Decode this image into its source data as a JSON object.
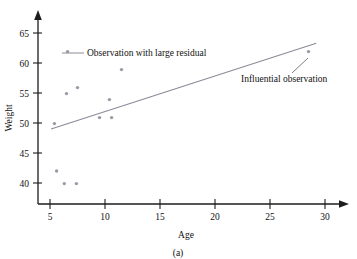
{
  "figure": {
    "caption": "(a)",
    "background": "#ffffff",
    "point_color": "#9a9aa6",
    "line_color": "#8b8b99",
    "axis_color": "#1d1d1d"
  },
  "chart_data": {
    "type": "scatter",
    "title": "",
    "xlabel": "Age",
    "ylabel": "Weight",
    "xlim": [
      3.2,
      32.5
    ],
    "ylim": [
      37.0,
      67.0
    ],
    "xticks": [
      5,
      10,
      15,
      20,
      25,
      30
    ],
    "yticks": [
      40,
      45,
      50,
      55,
      60,
      65
    ],
    "xtick_labels": [
      "5",
      "10",
      "15",
      "20",
      "25",
      "30"
    ],
    "ytick_labels": [
      "40",
      "45",
      "50",
      "55",
      "60",
      "65"
    ],
    "grid": false,
    "legend_position": "none",
    "points": [
      {
        "x": 5.4,
        "y": 49.9
      },
      {
        "x": 5.6,
        "y": 42.0
      },
      {
        "x": 6.3,
        "y": 39.9
      },
      {
        "x": 6.5,
        "y": 54.9
      },
      {
        "x": 6.6,
        "y": 61.9
      },
      {
        "x": 7.4,
        "y": 39.9
      },
      {
        "x": 7.5,
        "y": 55.9
      },
      {
        "x": 9.5,
        "y": 50.9
      },
      {
        "x": 10.4,
        "y": 53.9
      },
      {
        "x": 10.6,
        "y": 50.9
      },
      {
        "x": 11.5,
        "y": 58.9
      },
      {
        "x": 28.5,
        "y": 61.9
      }
    ],
    "fit_line": {
      "name": "least-squares regression line",
      "x_start": 5.1,
      "y_start": 49.0,
      "x_end": 29.2,
      "y_end": 63.3
    },
    "annotations": [
      {
        "name": "large-residual",
        "text": "Observation with large residual",
        "marker_x": 6.6,
        "marker_y": 61.9,
        "has_connector": true
      },
      {
        "name": "influential-observation",
        "text": "Influential observation",
        "marker_x": 28.5,
        "marker_y": 61.9,
        "has_connector": true
      }
    ]
  }
}
